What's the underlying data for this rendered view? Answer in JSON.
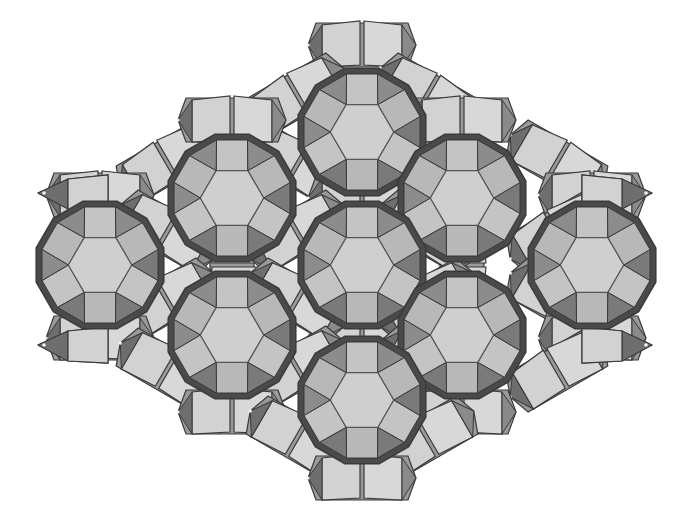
{
  "figure": {
    "type": "polyhedral framework tiling",
    "caption": "",
    "colors": {
      "background": "#ffffff",
      "edge": "#3a3a3a",
      "hexagon_face": "#cfcfcf",
      "square_face": "#c4c4c4",
      "dark_face": "#7a7a7a",
      "mid_face": "#a8a8a8",
      "rim": "#4a4a4a",
      "cube_light": "#d2d2d2",
      "cube_side": "#9a9a9a",
      "cube_dark": "#6e6e6e"
    },
    "cage_radius": 66,
    "cages": [
      {
        "id": "top",
        "cx": 362,
        "cy": 132
      },
      {
        "id": "upper-left",
        "cx": 232,
        "cy": 198
      },
      {
        "id": "upper-right",
        "cx": 462,
        "cy": 198
      },
      {
        "id": "left",
        "cx": 100,
        "cy": 265
      },
      {
        "id": "center",
        "cx": 362,
        "cy": 265
      },
      {
        "id": "right",
        "cx": 592,
        "cy": 265
      },
      {
        "id": "lower-left",
        "cx": 232,
        "cy": 335
      },
      {
        "id": "lower-right",
        "cx": 462,
        "cy": 335
      },
      {
        "id": "bottom",
        "cx": 362,
        "cy": 400
      }
    ],
    "links": [
      {
        "x": 362,
        "y": 45,
        "angle": 0
      },
      {
        "x": 297,
        "y": 95,
        "angle": -30
      },
      {
        "x": 427,
        "y": 95,
        "angle": 30
      },
      {
        "x": 167,
        "y": 162,
        "angle": -30
      },
      {
        "x": 297,
        "y": 165,
        "angle": 30
      },
      {
        "x": 427,
        "y": 165,
        "angle": -30
      },
      {
        "x": 557,
        "y": 162,
        "angle": 30
      },
      {
        "x": 232,
        "y": 120,
        "angle": 0
      },
      {
        "x": 462,
        "y": 120,
        "angle": 0
      },
      {
        "x": 100,
        "y": 195,
        "angle": 0
      },
      {
        "x": 592,
        "y": 195,
        "angle": 0
      },
      {
        "x": 232,
        "y": 265,
        "angle": 90
      },
      {
        "x": 462,
        "y": 265,
        "angle": 90
      },
      {
        "x": 167,
        "y": 232,
        "angle": 30
      },
      {
        "x": 557,
        "y": 232,
        "angle": -30
      },
      {
        "x": 167,
        "y": 300,
        "angle": -30
      },
      {
        "x": 557,
        "y": 300,
        "angle": 30
      },
      {
        "x": 362,
        "y": 198,
        "angle": 0
      },
      {
        "x": 362,
        "y": 333,
        "angle": 0
      },
      {
        "x": 297,
        "y": 232,
        "angle": -30
      },
      {
        "x": 427,
        "y": 232,
        "angle": 30
      },
      {
        "x": 297,
        "y": 300,
        "angle": 30
      },
      {
        "x": 427,
        "y": 300,
        "angle": -30
      },
      {
        "x": 100,
        "y": 338,
        "angle": 0
      },
      {
        "x": 592,
        "y": 338,
        "angle": 0
      },
      {
        "x": 167,
        "y": 370,
        "angle": 30
      },
      {
        "x": 557,
        "y": 370,
        "angle": -30
      },
      {
        "x": 297,
        "y": 368,
        "angle": -30
      },
      {
        "x": 427,
        "y": 368,
        "angle": 30
      },
      {
        "x": 232,
        "y": 412,
        "angle": 0
      },
      {
        "x": 462,
        "y": 412,
        "angle": 0
      },
      {
        "x": 297,
        "y": 438,
        "angle": 30
      },
      {
        "x": 427,
        "y": 438,
        "angle": -30
      },
      {
        "x": 362,
        "y": 478,
        "angle": 0
      }
    ],
    "spikes": [
      {
        "x": 38,
        "y": 193,
        "dir": "left"
      },
      {
        "x": 38,
        "y": 345,
        "dir": "left"
      },
      {
        "x": 652,
        "y": 193,
        "dir": "right"
      },
      {
        "x": 652,
        "y": 345,
        "dir": "right"
      }
    ]
  }
}
